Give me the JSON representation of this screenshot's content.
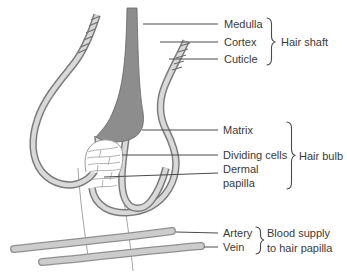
{
  "figure": {
    "type": "anatomical-diagram"
  },
  "labels": {
    "medulla": "Medulla",
    "cortex": "Cortex",
    "cuticle": "Cuticle",
    "hair_shaft": "Hair shaft",
    "matrix": "Matrix",
    "dividing_cells": "Dividing cells",
    "dermal_papilla_line1": "Dermal",
    "dermal_papilla_line2": "papilla",
    "hair_bulb": "Hair bulb",
    "artery": "Artery",
    "vein": "Vein",
    "blood_supply_line1": "Blood supply",
    "blood_supply_line2": "to hair papilla"
  },
  "colors": {
    "background": "#ffffff",
    "hair_shaft_fill": "#8d8d8d",
    "hair_shaft_outline": "#666666",
    "follicle_wall_edge": "#7a7a7a",
    "follicle_wall_fill": "#d9d9d9",
    "vessel_edge": "#909090",
    "vessel_fill": "#cccccc",
    "leader_line": "#4a4a4a",
    "text": "#3a3a3a",
    "papilla_fill": "#ffffff"
  }
}
